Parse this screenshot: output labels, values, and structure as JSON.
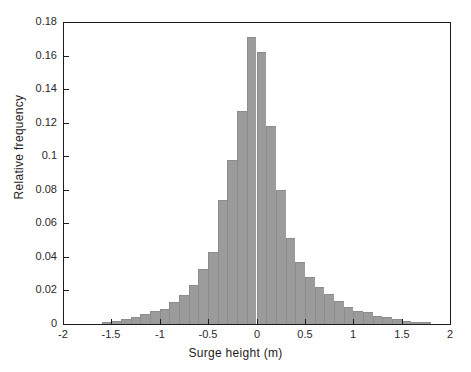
{
  "chart_data": {
    "type": "bar",
    "title": "",
    "subtitle": "",
    "xlabel": "Surge height (m)",
    "ylabel": "Relative frequency",
    "xlim": [
      -2,
      2
    ],
    "ylim": [
      0,
      0.18
    ],
    "bin_width": 0.1,
    "grid": false,
    "legend": null,
    "bar_color": "#9b9b9b",
    "axis_color": "#1c1c1c",
    "xticks": [
      -2,
      -1.5,
      -1,
      -0.5,
      0,
      0.5,
      1,
      1.5,
      2
    ],
    "xtick_labels": [
      "-2",
      "-1.5",
      "-1",
      "-0.5",
      "0",
      "0.5",
      "1",
      "1.5",
      "2"
    ],
    "yticks": [
      0,
      0.02,
      0.04,
      0.06,
      0.08,
      0.1,
      0.12,
      0.14,
      0.16,
      0.18
    ],
    "ytick_labels": [
      "0",
      "0.02",
      "0.04",
      "0.06",
      "0.08",
      "0.1",
      "0.12",
      "0.14",
      "0.16",
      "0.18"
    ],
    "bin_left_edges": [
      -1.6,
      -1.5,
      -1.4,
      -1.3,
      -1.2,
      -1.1,
      -1.0,
      -0.9,
      -0.8,
      -0.7,
      -0.6,
      -0.5,
      -0.4,
      -0.3,
      -0.2,
      -0.1,
      0.0,
      0.1,
      0.2,
      0.3,
      0.4,
      0.5,
      0.6,
      0.7,
      0.8,
      0.9,
      1.0,
      1.1,
      1.2,
      1.3,
      1.4,
      1.5,
      1.6,
      1.7
    ],
    "bin_centers": [
      -1.55,
      -1.45,
      -1.35,
      -1.25,
      -1.15,
      -1.05,
      -0.95,
      -0.85,
      -0.75,
      -0.65,
      -0.55,
      -0.45,
      -0.35,
      -0.25,
      -0.15,
      -0.05,
      0.05,
      0.15,
      0.25,
      0.35,
      0.45,
      0.55,
      0.65,
      0.75,
      0.85,
      0.95,
      1.05,
      1.15,
      1.25,
      1.35,
      1.45,
      1.55,
      1.65,
      1.75
    ],
    "values": [
      0.001,
      0.002,
      0.003,
      0.004,
      0.006,
      0.008,
      0.009,
      0.013,
      0.017,
      0.023,
      0.033,
      0.043,
      0.074,
      0.098,
      0.127,
      0.171,
      0.162,
      0.118,
      0.08,
      0.051,
      0.037,
      0.028,
      0.022,
      0.018,
      0.014,
      0.01,
      0.008,
      0.007,
      0.005,
      0.004,
      0.003,
      0.002,
      0.001,
      0.001
    ]
  }
}
